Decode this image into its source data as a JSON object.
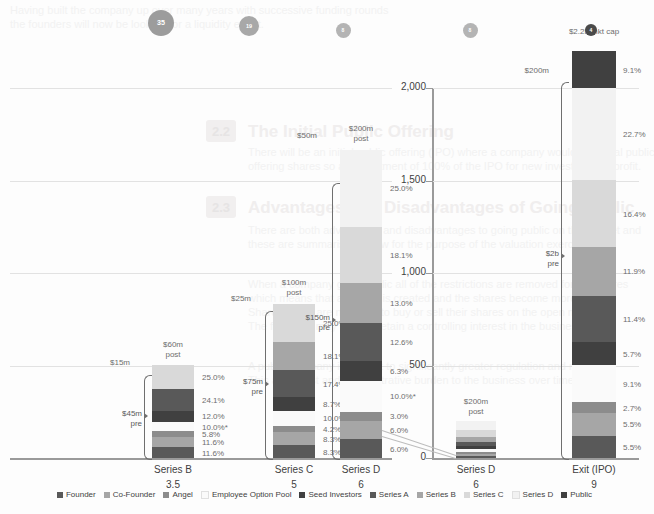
{
  "chart_data": {
    "type": "bar",
    "title": "",
    "xlabel": "",
    "ylabel": "",
    "subtitle": "",
    "categories": [
      "Series B",
      "Series C",
      "Series D",
      "Series D",
      "Exit (IPO)"
    ],
    "category_sublabels": [
      "3.5",
      "5",
      "6",
      "6",
      "9"
    ],
    "legend": [
      {
        "label": "Founder",
        "color": "#595959"
      },
      {
        "label": "Co-Founder",
        "color": "#a6a6a6"
      },
      {
        "label": "Angel",
        "color": "#8c8c8c"
      },
      {
        "label": "Employee Option Pool",
        "color": "#fafafa"
      },
      {
        "label": "Seed Investors",
        "color": "#404040"
      },
      {
        "label": "Series A",
        "color": "#595959"
      },
      {
        "label": "Series B",
        "color": "#a6a6a6"
      },
      {
        "label": "Series C",
        "color": "#d9d9d9"
      },
      {
        "label": "Series D",
        "color": "#f2f2f2"
      },
      {
        "label": "Public",
        "color": "#404040"
      }
    ],
    "legend_position": "bottom",
    "grid": true,
    "left_panel": {
      "ylim": [
        0,
        240
      ],
      "gridlines": [
        60,
        120,
        180,
        240
      ],
      "columns": [
        {
          "name": "Series B",
          "sublabel": "3.5",
          "headcount_badge": "35",
          "top_label": "$60m\npost",
          "post_label": "$60m",
          "post_sub": "post",
          "raise_label": "$15m",
          "pre_label": "$45m",
          "pre_sub": "pre",
          "total": 60,
          "segments": [
            {
              "name": "Founder",
              "pct": "11.6%",
              "value": 11.6,
              "color": "#595959"
            },
            {
              "name": "Co-Founder",
              "pct": "11.6%",
              "value": 11.6,
              "color": "#a6a6a6"
            },
            {
              "name": "Angel",
              "pct": "5.8%",
              "value": 5.8,
              "color": "#8c8c8c"
            },
            {
              "name": "Employee Option Pool",
              "pct": "10.0%*",
              "value": 10.0,
              "color": "#fafafa"
            },
            {
              "name": "Seed Investors",
              "pct": "12.0%",
              "value": 12.0,
              "color": "#404040"
            },
            {
              "name": "Series A",
              "pct": "24.1%",
              "value": 24.1,
              "color": "#595959"
            },
            {
              "name": "Series B",
              "pct": "25.0%",
              "value": 25.0,
              "color": "#d9d9d9"
            }
          ]
        },
        {
          "name": "Series C",
          "sublabel": "5",
          "headcount_badge": "19",
          "post_label": "$100m",
          "post_sub": "post",
          "raise_label": "$25m",
          "pre_label": "$75m",
          "pre_sub": "pre",
          "total": 100,
          "segments": [
            {
              "name": "Founder",
              "pct": "8.3%",
              "value": 8.3,
              "color": "#595959"
            },
            {
              "name": "Co-Founder",
              "pct": "8.3%",
              "value": 8.3,
              "color": "#a6a6a6"
            },
            {
              "name": "Angel",
              "pct": "4.2%",
              "value": 4.2,
              "color": "#8c8c8c"
            },
            {
              "name": "Employee Option Pool",
              "pct": "10.0%*",
              "value": 10.0,
              "color": "#fafafa"
            },
            {
              "name": "Seed Investors",
              "pct": "8.7%",
              "value": 8.7,
              "color": "#404040"
            },
            {
              "name": "Series A",
              "pct": "17.4%",
              "value": 17.4,
              "color": "#595959"
            },
            {
              "name": "Series B",
              "pct": "18.1%",
              "value": 18.1,
              "color": "#a6a6a6"
            },
            {
              "name": "Series C",
              "pct": "25.0%",
              "value": 25.0,
              "color": "#d9d9d9"
            }
          ]
        },
        {
          "name": "Series D",
          "sublabel": "6",
          "headcount_badge": "8",
          "post_label": "$200m",
          "post_sub": "post",
          "raise_label": "$50m",
          "pre_label": "$150m",
          "pre_sub": "pre",
          "total": 200,
          "segments": [
            {
              "name": "Founder",
              "pct": "6.0%",
              "value": 6.0,
              "color": "#595959"
            },
            {
              "name": "Co-Founder",
              "pct": "6.0%",
              "value": 6.0,
              "color": "#a6a6a6"
            },
            {
              "name": "Angel",
              "pct": "3.0%",
              "value": 3.0,
              "color": "#8c8c8c"
            },
            {
              "name": "Employee Option Pool",
              "pct": "10.0%*",
              "value": 10.0,
              "color": "#fafafa"
            },
            {
              "name": "Seed Investors",
              "pct": "6.3%",
              "value": 6.3,
              "color": "#404040"
            },
            {
              "name": "Series A",
              "pct": "12.6%",
              "value": 12.6,
              "color": "#595959"
            },
            {
              "name": "Series B",
              "pct": "13.0%",
              "value": 13.0,
              "color": "#a6a6a6"
            },
            {
              "name": "Series C",
              "pct": "18.1%",
              "value": 18.1,
              "color": "#d9d9d9"
            },
            {
              "name": "Series D",
              "pct": "25.0%",
              "value": 25.0,
              "color": "#f2f2f2"
            }
          ]
        }
      ]
    },
    "right_panel": {
      "ylim": [
        0,
        2200
      ],
      "yticks": [
        "0",
        "500",
        "1,000",
        "1,500",
        "2,000"
      ],
      "ytick_values": [
        0,
        500,
        1000,
        1500,
        2000
      ],
      "columns": [
        {
          "name": "Series D",
          "sublabel": "6",
          "headcount_badge": "8",
          "post_label": "$200m",
          "post_sub": "post",
          "total": 200,
          "segments": [
            {
              "name": "Founder",
              "pct": "6.0%",
              "value": 6.0,
              "color": "#595959"
            },
            {
              "name": "Co-Founder",
              "pct": "6.0%",
              "value": 6.0,
              "color": "#a6a6a6"
            },
            {
              "name": "Angel",
              "pct": "3.0%",
              "value": 3.0,
              "color": "#8c8c8c"
            },
            {
              "name": "Employee Option Pool",
              "pct": "10.0%*",
              "value": 10.0,
              "color": "#fafafa"
            },
            {
              "name": "Seed Investors",
              "pct": "6.3%",
              "value": 6.3,
              "color": "#404040"
            },
            {
              "name": "Series A",
              "pct": "12.6%",
              "value": 12.6,
              "color": "#595959"
            },
            {
              "name": "Series B",
              "pct": "13.0%",
              "value": 13.0,
              "color": "#a6a6a6"
            },
            {
              "name": "Series C",
              "pct": "18.1%",
              "value": 18.1,
              "color": "#d9d9d9"
            },
            {
              "name": "Series D",
              "pct": "25.0%",
              "value": 25.0,
              "color": "#f2f2f2"
            }
          ]
        },
        {
          "name": "Exit (IPO)",
          "sublabel": "9",
          "headcount_badge": "4",
          "post_label": "$2.2b mkt cap",
          "post_sub": "",
          "raise_label": "$200m",
          "pre_label": "$2b",
          "pre_sub": "pre",
          "total": 2200,
          "segments": [
            {
              "name": "Founder",
              "pct": "5.5%",
              "value": 5.5,
              "color": "#595959"
            },
            {
              "name": "Co-Founder",
              "pct": "5.5%",
              "value": 5.5,
              "color": "#a6a6a6"
            },
            {
              "name": "Angel",
              "pct": "2.7%",
              "value": 2.7,
              "color": "#8c8c8c"
            },
            {
              "name": "Employee Option Pool",
              "pct": "9.1%",
              "value": 9.1,
              "color": "#fafafa"
            },
            {
              "name": "Seed Investors",
              "pct": "5.7%",
              "value": 5.7,
              "color": "#404040"
            },
            {
              "name": "Series A",
              "pct": "11.4%",
              "value": 11.4,
              "color": "#595959"
            },
            {
              "name": "Series B",
              "pct": "11.9%",
              "value": 11.9,
              "color": "#a6a6a6"
            },
            {
              "name": "Series C",
              "pct": "16.4%",
              "value": 16.4,
              "color": "#d9d9d9"
            },
            {
              "name": "Series D",
              "pct": "22.7%",
              "value": 22.7,
              "color": "#f2f2f2"
            },
            {
              "name": "Public",
              "pct": "9.1%",
              "value": 9.1,
              "color": "#404040"
            }
          ]
        }
      ]
    }
  },
  "background_document": {
    "heading_1": "The Initial Public Offering",
    "heading_2": "Advantages and Disadvantages of Going Public",
    "badge_1": "2.2",
    "badge_2": "2.3"
  }
}
